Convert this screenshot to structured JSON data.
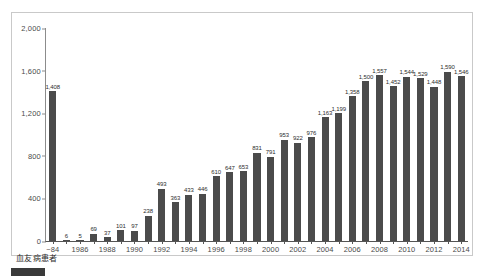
{
  "chart_data": {
    "type": "bar",
    "title": "",
    "xlabel": "血友病患者",
    "ylabel": "",
    "ylim": [
      0,
      2000
    ],
    "ytick_values": [
      0,
      400,
      800,
      1200,
      1600,
      2000
    ],
    "ytick_labels": [
      "0",
      "400",
      "800",
      "1,200",
      "1,600",
      "2,000"
    ],
    "grid": false,
    "legend_position": "none",
    "bar_color": "#4b4b4b",
    "categories": [
      "~84",
      "1985",
      "1986",
      "1987",
      "1988",
      "1989",
      "1990",
      "1991",
      "1992",
      "1993",
      "1994",
      "1995",
      "1996",
      "1997",
      "1998",
      "1999",
      "2000",
      "2001",
      "2002",
      "2003",
      "2004",
      "2005",
      "2006",
      "2007",
      "2008",
      "2009",
      "2010",
      "2011",
      "2012",
      "2013",
      "2014"
    ],
    "xtick_labels": [
      "~84",
      "1986",
      "1988",
      "1990",
      "1992",
      "1994",
      "1996",
      "1998",
      "2000",
      "2002",
      "2004",
      "2006",
      "2008",
      "2010",
      "2012",
      "2014"
    ],
    "values": [
      1408,
      6,
      5,
      69,
      37,
      101,
      97,
      238,
      493,
      363,
      433,
      446,
      610,
      647,
      653,
      831,
      791,
      953,
      922,
      976,
      1163,
      1199,
      1358,
      1500,
      1557,
      1452,
      1544,
      1529,
      1448,
      1590,
      1546
    ],
    "value_labels": [
      "1,408",
      "6",
      "5",
      "69",
      "37",
      "101",
      "97",
      "238",
      "493",
      "363",
      "433",
      "446",
      "610",
      "647",
      "653",
      "831",
      "791",
      "953",
      "922",
      "976",
      "1,163",
      "1,199",
      "1,358",
      "1,500",
      "1,557",
      "1,452",
      "1,544",
      "1,529",
      "1,448",
      "1,590",
      "1,546"
    ]
  },
  "legend": {
    "swatch_color": "#3a3a3a",
    "text": ""
  }
}
